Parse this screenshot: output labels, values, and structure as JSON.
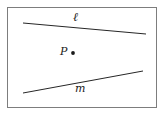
{
  "figure": {
    "type": "geometry-diagram",
    "frame": {
      "border_color": "#7d7d7d",
      "background_color": "#ffffff",
      "x": 7,
      "y": 7,
      "width": 150,
      "height": 101
    },
    "stroke_color": "#262626",
    "lines": [
      {
        "id": "line-l",
        "label": "ℓ",
        "label_name": "line-label-l",
        "x1": 23,
        "y1": 23,
        "x2": 146,
        "y2": 34,
        "label_x": 73,
        "label_y": 11
      },
      {
        "id": "line-m",
        "label": "m",
        "label_name": "line-label-m",
        "x1": 23,
        "y1": 93,
        "x2": 143,
        "y2": 71,
        "label_x": 75,
        "label_y": 83
      }
    ],
    "points": [
      {
        "id": "point-p",
        "label": "P",
        "dot_x": 73,
        "dot_y": 53,
        "dot_radius": 1.9,
        "label_x": 60,
        "label_y": 46
      }
    ]
  }
}
